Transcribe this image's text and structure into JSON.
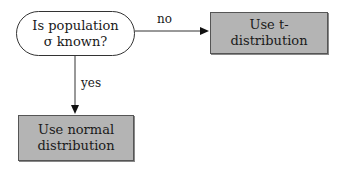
{
  "nodes": {
    "decision": {
      "line1": "Is population",
      "line2": "σ known?"
    },
    "t_dist": {
      "label": "Use t-distribution"
    },
    "normal": {
      "line1": "Use normal",
      "line2": "distribution"
    }
  },
  "edges": {
    "no": {
      "label": "no"
    },
    "yes": {
      "label": "yes"
    }
  },
  "colors": {
    "process_fill": "#b4b4b4",
    "stroke": "#333333"
  }
}
